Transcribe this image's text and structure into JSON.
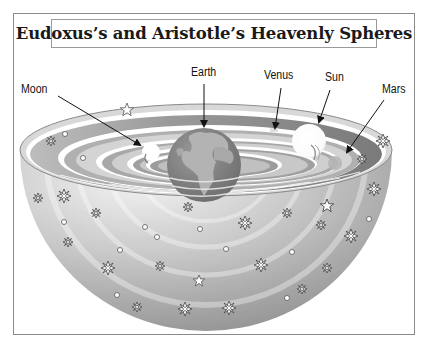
{
  "title": "Eudoxus’s and Aristotle’s Heavenly Spheres",
  "labels": {
    "moon": "Moon",
    "earth": "Earth",
    "venus": "Venus",
    "sun": "Sun",
    "mars": "Mars"
  },
  "bodies": [
    {
      "name": "Earth",
      "cx": 204,
      "cy": 165,
      "r": 37,
      "color": "#7f7f7f"
    },
    {
      "name": "Moon",
      "cx": 151,
      "cy": 152,
      "r": 9,
      "color": "#ffffff"
    },
    {
      "name": "Venus",
      "cx": 276,
      "cy": 131,
      "r": 0,
      "color": "#cfcfcf"
    },
    {
      "name": "Sun",
      "cx": 309,
      "cy": 141,
      "r": 17,
      "color": "#ffffff"
    },
    {
      "name": "Mars",
      "cx": 336,
      "cy": 162,
      "r": 6,
      "color": "#b8b8b8"
    }
  ],
  "colors": {
    "sphere_light": "#ececec",
    "sphere_dark": "#8c8c8c",
    "frame": "#8a8a8a",
    "text": "#111111"
  }
}
